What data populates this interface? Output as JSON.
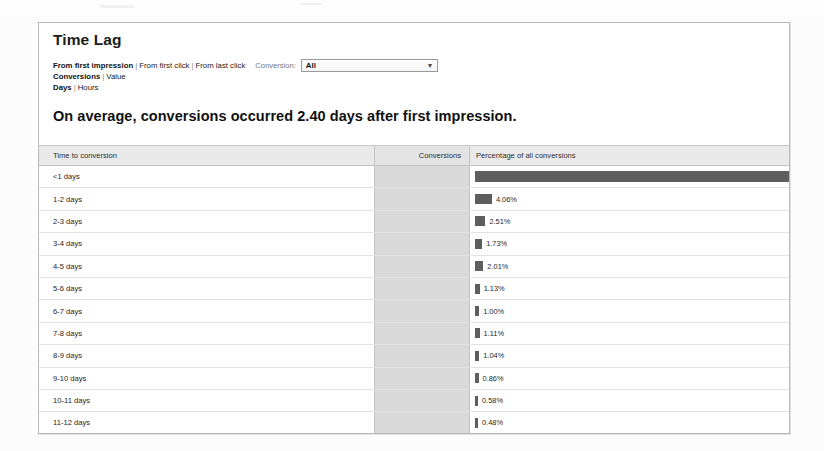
{
  "report": {
    "title": "Time Lag",
    "headline": "On average, conversions occurred 2.40 days after first impression."
  },
  "controls": {
    "attribution_links": [
      {
        "label": "From first impression",
        "active": true
      },
      {
        "label": "From first click",
        "active": false
      },
      {
        "label": "From last click",
        "active": false
      }
    ],
    "metric_links": [
      {
        "label": "Conversions",
        "active": true
      },
      {
        "label": "Value",
        "active": false
      }
    ],
    "unit_links": [
      {
        "label": "Days",
        "active": true
      },
      {
        "label": "Hours",
        "active": false
      }
    ],
    "conversion_filter": {
      "label": "Conversion:",
      "value": "All",
      "arrow": "chevron-down-icon"
    },
    "separator": "|"
  },
  "table": {
    "columns": [
      "Time to conversion",
      "Conversions",
      "Percentage of all conversions"
    ]
  },
  "chart_data": {
    "type": "bar",
    "title": "Time Lag",
    "subtitle": "On average, conversions occurred 2.40 days after first impression.",
    "xlabel": "Percentage of all conversions",
    "ylabel": "Time to conversion",
    "xlim": [
      0,
      80
    ],
    "grid": false,
    "legend": null,
    "orientation": "horizontal",
    "average_days": 2.4,
    "categories": [
      "<1 days",
      "1-2 days",
      "2-3 days",
      "3-4 days",
      "4-5 days",
      "5-6 days",
      "6-7 days",
      "7-8 days",
      "8-9 days",
      "9-10 days",
      "10-11 days",
      "11-12 days",
      "12+ days"
    ],
    "values": [
      75.71,
      4.06,
      2.51,
      1.73,
      2.01,
      1.13,
      1.0,
      1.11,
      1.04,
      0.86,
      0.58,
      0.48,
      7.78
    ],
    "value_labels": [
      "75.71%",
      "4.06%",
      "2.51%",
      "1.73%",
      "2.01%",
      "1.13%",
      "1.00%",
      "1.11%",
      "1.04%",
      "0.86%",
      "0.58%",
      "0.48%",
      "7.78%"
    ],
    "conversions": [
      "",
      "",
      "",
      "",
      "",
      "",
      "",
      "",
      "",
      "",
      "",
      "",
      ""
    ],
    "bar_color": "#5e5e5e"
  }
}
